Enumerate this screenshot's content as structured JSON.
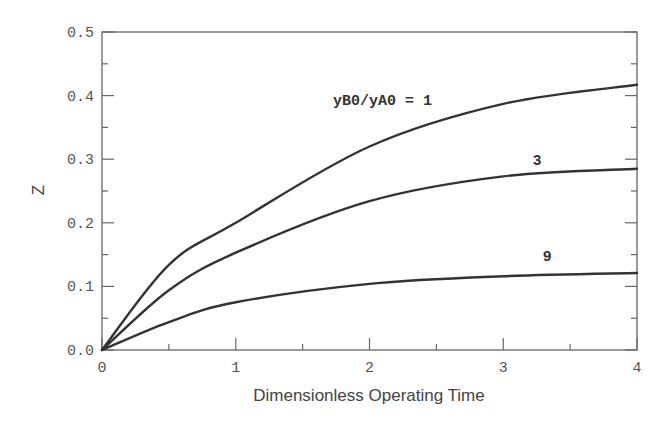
{
  "chart_data": {
    "type": "line",
    "title": "",
    "xlabel": "Dimensionless Operating Time",
    "ylabel": "Z",
    "xlim": [
      0,
      4
    ],
    "ylim": [
      0,
      0.5
    ],
    "x_ticks": [
      "0",
      "1",
      "2",
      "3",
      "4"
    ],
    "y_ticks": [
      "0.0",
      "0.1",
      "0.2",
      "0.3",
      "0.4",
      "0.5"
    ],
    "grid": false,
    "legend": "inline labels",
    "x": [
      0,
      0.5,
      1,
      2,
      3,
      4
    ],
    "series": [
      {
        "name": "yB0/yA0 = 1",
        "label": "yB0/yA0 = 1",
        "values": [
          0,
          0.134,
          0.2,
          0.32,
          0.387,
          0.417
        ]
      },
      {
        "name": "yB0/yA0 = 3",
        "label": "3",
        "values": [
          0,
          0.094,
          0.153,
          0.234,
          0.273,
          0.285
        ]
      },
      {
        "name": "yB0/yA0 = 9",
        "label": "9",
        "values": [
          0,
          0.044,
          0.075,
          0.104,
          0.116,
          0.121
        ]
      }
    ]
  }
}
